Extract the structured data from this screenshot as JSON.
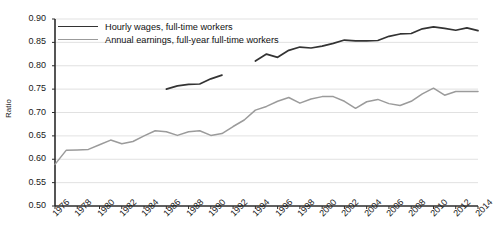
{
  "chart_data": {
    "type": "line",
    "title": "",
    "xlabel": "",
    "ylabel": "Ratio",
    "ylim": [
      0.5,
      0.9
    ],
    "ytick_labels": [
      "0.90",
      "0.85",
      "0.80",
      "0.75",
      "0.70",
      "0.65",
      "0.60",
      "0.55",
      "0.50"
    ],
    "ytick_values": [
      0.9,
      0.85,
      0.8,
      0.75,
      0.7,
      0.65,
      0.6,
      0.55,
      0.5
    ],
    "xlim": [
      1976,
      2014
    ],
    "xtick_labels": [
      "1976",
      "1978",
      "1980",
      "1982",
      "1984",
      "1986",
      "1988",
      "1990",
      "1992",
      "1994",
      "1996",
      "1998",
      "2000",
      "2002",
      "2004",
      "2006",
      "2008",
      "2010",
      "2012",
      "2014"
    ],
    "xtick_values": [
      1976,
      1978,
      1980,
      1982,
      1984,
      1986,
      1988,
      1990,
      1992,
      1994,
      1996,
      1998,
      2000,
      2002,
      2004,
      2006,
      2008,
      2010,
      2012,
      2014
    ],
    "grid": true,
    "legend_position": "top-left",
    "series": [
      {
        "name": "Hourly wages, full-time workers",
        "color": "#333333",
        "x": [
          1986,
          1987,
          1988,
          1989,
          1990,
          1991,
          1994,
          1995,
          1996,
          1997,
          1998,
          1999,
          2000,
          2001,
          2002,
          2003,
          2004,
          2005,
          2006,
          2007,
          2008,
          2009,
          2010,
          2011,
          2012,
          2013,
          2014
        ],
        "values": [
          0.75,
          0.757,
          0.76,
          0.761,
          0.772,
          0.78,
          0.81,
          0.825,
          0.818,
          0.833,
          0.84,
          0.838,
          0.842,
          0.848,
          0.855,
          0.853,
          0.853,
          0.854,
          0.863,
          0.868,
          0.869,
          0.879,
          0.883,
          0.88,
          0.876,
          0.881,
          0.875
        ]
      },
      {
        "name": "Annual earnings, full-year full-time workers",
        "color": "#9b9b9b",
        "x": [
          1976,
          1977,
          1978,
          1979,
          1980,
          1981,
          1982,
          1983,
          1984,
          1985,
          1986,
          1987,
          1988,
          1989,
          1990,
          1991,
          1992,
          1993,
          1994,
          1995,
          1996,
          1997,
          1998,
          1999,
          2000,
          2001,
          2002,
          2003,
          2004,
          2005,
          2006,
          2007,
          2008,
          2009,
          2010,
          2011,
          2012,
          2013,
          2014
        ],
        "values": [
          0.589,
          0.619,
          0.62,
          0.621,
          0.631,
          0.641,
          0.633,
          0.638,
          0.65,
          0.661,
          0.659,
          0.651,
          0.659,
          0.661,
          0.651,
          0.655,
          0.67,
          0.684,
          0.705,
          0.713,
          0.724,
          0.732,
          0.72,
          0.729,
          0.734,
          0.734,
          0.724,
          0.709,
          0.723,
          0.728,
          0.719,
          0.715,
          0.724,
          0.74,
          0.752,
          0.737,
          0.745,
          0.745,
          0.745
        ]
      }
    ]
  },
  "legend": {
    "items": [
      {
        "label": "Hourly wages, full-time workers"
      },
      {
        "label": "Annual earnings, full-year full-time workers"
      }
    ]
  },
  "axis": {
    "y_title": "Ratio"
  }
}
